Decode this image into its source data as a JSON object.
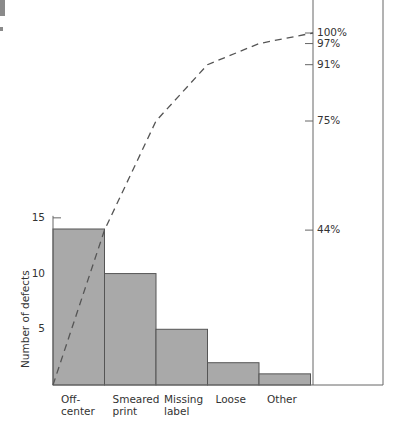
{
  "chart_data": {
    "type": "bar",
    "subtype": "pareto",
    "title": "",
    "xlabel": "",
    "ylabel": "Number of defects",
    "categories": [
      "Off-center",
      "Smeared print",
      "Missing label",
      "Loose",
      "Other"
    ],
    "category_labels": [
      [
        "Off-",
        "center"
      ],
      [
        "Smeared",
        "print"
      ],
      [
        "Missing",
        "label"
      ],
      [
        "Loose"
      ],
      [
        "Other"
      ]
    ],
    "values": [
      14,
      10,
      5,
      2,
      1
    ],
    "cumulative_percent": [
      44,
      75,
      91,
      97,
      100
    ],
    "cumulative_percent_labels": [
      "100%",
      "97%",
      "91%",
      "75%",
      "44%"
    ],
    "ylim": [
      0,
      16
    ],
    "yticks": [
      5,
      10,
      15
    ],
    "ytick_labels": [
      "5",
      "10",
      "15"
    ],
    "secondary_axis": "cumulative percent (right)",
    "line_style": "dashed",
    "grid": false,
    "legend": "none"
  },
  "colors": {
    "bar_fill": "#a9a9a9",
    "bar_stroke": "#555555",
    "axis": "#666666",
    "line": "#555555",
    "text": "#333333"
  }
}
